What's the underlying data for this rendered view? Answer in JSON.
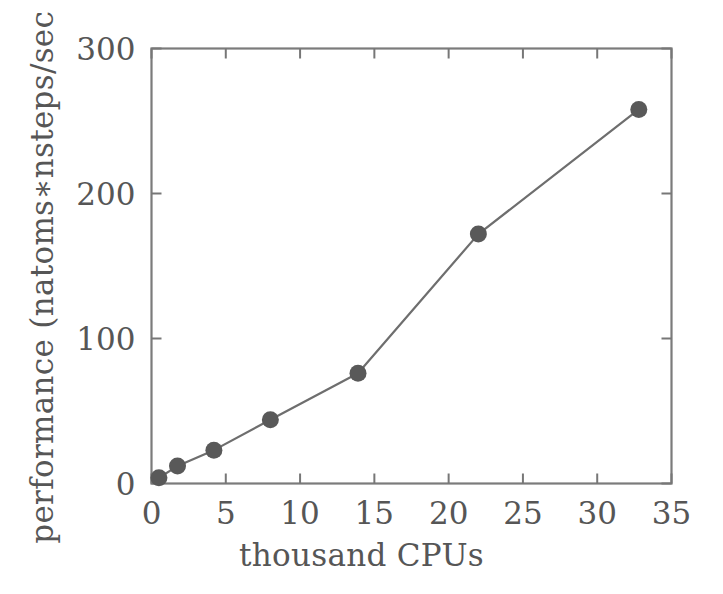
{
  "chart_data": {
    "type": "line",
    "title": "",
    "subtitle": "",
    "xlabel": "thousand CPUs",
    "ylabel": "performance (natoms∗nsteps/sec )",
    "xlim": [
      0,
      35
    ],
    "ylim": [
      0,
      300
    ],
    "xticks": [
      0,
      5,
      10,
      15,
      20,
      25,
      30,
      35
    ],
    "yticks": [
      0,
      100,
      200,
      300
    ],
    "xtick_labels": [
      "0",
      "5",
      "10",
      "15",
      "20",
      "25",
      "30",
      "35"
    ],
    "ytick_labels": [
      "0",
      "100",
      "200",
      "300"
    ],
    "grid": false,
    "legend": false,
    "legend_position": "none",
    "marker": "filled-circle",
    "marker_color": "#595959",
    "line_color": "#6e6e6e",
    "frame_color": "#777777",
    "background_color": "#ffffff",
    "x": [
      0.5,
      1.75,
      4.2,
      8.0,
      13.9,
      22.0,
      32.8
    ],
    "values": [
      4,
      12,
      23,
      44,
      76,
      172,
      258
    ],
    "series": [
      {
        "name": "performance",
        "points": [
          {
            "x": 0.5,
            "y": 4
          },
          {
            "x": 1.75,
            "y": 12
          },
          {
            "x": 4.2,
            "y": 23
          },
          {
            "x": 8.0,
            "y": 44
          },
          {
            "x": 13.9,
            "y": 76
          },
          {
            "x": 22.0,
            "y": 172
          },
          {
            "x": 32.8,
            "y": 258
          }
        ]
      }
    ]
  },
  "figure": {
    "name": "performance-scaling-plot"
  }
}
